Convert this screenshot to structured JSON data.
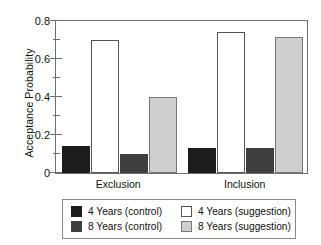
{
  "chart_data": {
    "type": "bar",
    "title": "",
    "xlabel": "",
    "ylabel": "Acceptance Probability",
    "ylim": [
      0,
      0.8
    ],
    "ytick_labels": [
      "0",
      "0.2",
      "0.4",
      "0.6",
      "0.8"
    ],
    "ytick_values": [
      0,
      0.2,
      0.4,
      0.6,
      0.8
    ],
    "yminor_values": [
      0.1,
      0.3,
      0.5,
      0.7
    ],
    "grid": false,
    "legend_position": "below-center",
    "categories": [
      "Exclusion",
      "Inclusion"
    ],
    "series": [
      {
        "name": "4 Years (control)",
        "key": "black",
        "values": [
          0.14,
          0.13
        ]
      },
      {
        "name": "4 Years (suggestion)",
        "key": "white",
        "values": [
          0.7,
          0.74
        ]
      },
      {
        "name": "8 Years (control)",
        "key": "dark",
        "values": [
          0.1,
          0.13
        ]
      },
      {
        "name": "8 Years (suggestion)",
        "key": "light",
        "values": [
          0.4,
          0.715
        ]
      }
    ],
    "bar_draw_order": [
      "black",
      "white",
      "dark",
      "light"
    ]
  },
  "legend": {
    "entries": [
      {
        "label": "4 Years (control)",
        "swatch": "black"
      },
      {
        "label": "4 Years (suggestion)",
        "swatch": "white"
      },
      {
        "label": "8 Years (control)",
        "swatch": "dark"
      },
      {
        "label": "8 Years (suggestion)",
        "swatch": "light"
      }
    ]
  },
  "colors": {
    "black": "#1c1c1c",
    "dark": "#3f3f3f",
    "white": "#ffffff",
    "light": "#cfcfcf",
    "axis": "#6f6f6f",
    "text": "#111111"
  }
}
